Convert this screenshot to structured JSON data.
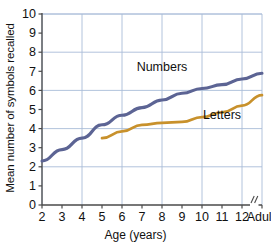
{
  "chart_data": {
    "type": "line",
    "title": "",
    "xlabel": "Age (years)",
    "ylabel": "Mean number of symbols recalled",
    "ylim": [
      0,
      10
    ],
    "ytick_labels": [
      "0",
      "1",
      "2",
      "3",
      "4",
      "5",
      "6",
      "7",
      "8",
      "9",
      "10"
    ],
    "ytick_values": [
      0,
      1,
      2,
      3,
      4,
      5,
      6,
      7,
      8,
      9,
      10
    ],
    "y_gridlines": [
      2,
      4,
      6,
      8,
      10
    ],
    "xtick_labels": [
      "2",
      "3",
      "4",
      "5",
      "6",
      "7",
      "8",
      "9",
      "10",
      "11",
      "12",
      "Adults"
    ],
    "x_gridline_labels": [
      "2",
      "4",
      "6",
      "8",
      "10",
      "12"
    ],
    "axis_break_marker": "//",
    "grid": true,
    "legend": "inline-annotations",
    "series": [
      {
        "name": "Numbers",
        "color": "#5c6494",
        "x": [
          "2",
          "3",
          "4",
          "5",
          "6",
          "7",
          "8",
          "9",
          "10",
          "11",
          "12",
          "Adults"
        ],
        "values": [
          2.3,
          2.9,
          3.5,
          4.2,
          4.7,
          5.1,
          5.5,
          5.85,
          6.1,
          6.3,
          6.6,
          6.9
        ]
      },
      {
        "name": "Letters",
        "color": "#c8912c",
        "x": [
          "5",
          "6",
          "7",
          "8",
          "9",
          "10",
          "11",
          "12",
          "Adults"
        ],
        "values": [
          3.5,
          3.85,
          4.2,
          4.3,
          4.35,
          4.6,
          4.85,
          5.2,
          5.75
        ]
      }
    ],
    "annotations": [
      {
        "text": "Numbers",
        "x": "8",
        "y": 7.0
      },
      {
        "text": "Letters",
        "x": "11",
        "y": 4.5
      }
    ]
  },
  "figure": {
    "colors": {
      "grid": "#a9bcd8",
      "axis": "#4a4a4a",
      "numbers_line": "#5c6494",
      "letters_line": "#c8912c",
      "text": "#111111",
      "background": "#ffffff"
    },
    "caption_sliver": ""
  }
}
